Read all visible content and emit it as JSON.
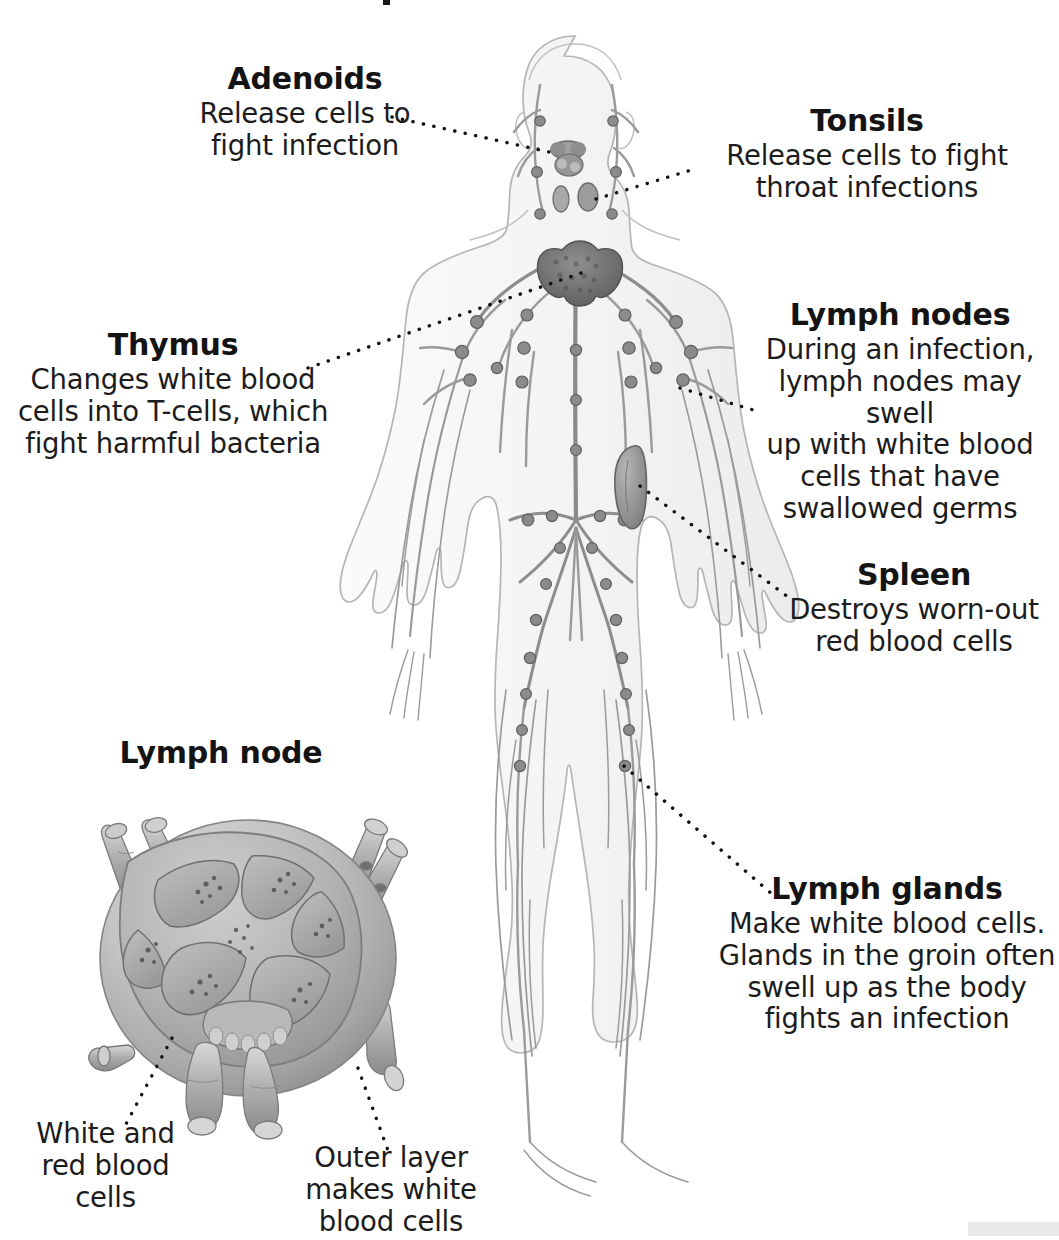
{
  "diagram": {
    "title_visible": false,
    "style": "grayscale pencil anatomical illustration"
  },
  "labels": {
    "adenoids": {
      "heading": "Adenoids",
      "lines": [
        "Release cells to",
        "fight infection"
      ]
    },
    "tonsils": {
      "heading": "Tonsils",
      "lines": [
        "Release cells to fight",
        "throat infections"
      ]
    },
    "lymph_nodes": {
      "heading": "Lymph nodes",
      "lines": [
        "During an infection,",
        "lymph nodes may swell",
        "up with white blood",
        "cells that have",
        "swallowed germs"
      ]
    },
    "thymus": {
      "heading": "Thymus",
      "lines": [
        "Changes white blood",
        "cells into T-cells, which",
        "fight harmful bacteria"
      ]
    },
    "spleen": {
      "heading": "Spleen",
      "lines": [
        "Destroys worn-out",
        "red blood cells"
      ]
    },
    "lymph_glands": {
      "heading": "Lymph glands",
      "lines": [
        "Make white blood cells.",
        "Glands in the groin often",
        "swell up as the body",
        "fights an infection"
      ]
    },
    "lymph_node_inset": {
      "heading": "Lymph node"
    },
    "white_red_cells": {
      "lines": [
        "White and",
        "red blood",
        "cells"
      ]
    },
    "outer_layer": {
      "lines": [
        "Outer layer",
        "makes white",
        "blood cells"
      ]
    }
  },
  "colors": {
    "text": "#1a1a1a",
    "leader_line": "#111111",
    "body_outline": "#b9b9b9",
    "body_fill": "#f7f7f7",
    "vessel": "#8e8e8e",
    "node": "#6d6d6d",
    "organ_dark": "#6a6a6a",
    "inset_mid": "#b4b4b4",
    "inset_dark": "#808080",
    "corner_band": "#e8e8e8",
    "background": "#ffffff"
  }
}
